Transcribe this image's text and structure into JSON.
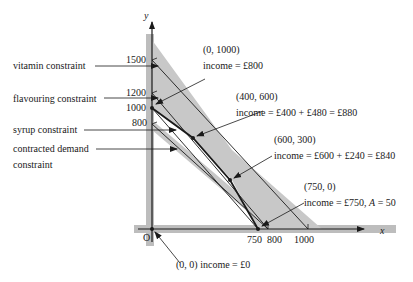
{
  "axes": {
    "x_label": "x",
    "y_label": "y",
    "origin_label": "O",
    "x_ticks": [
      "750",
      "800",
      "1000"
    ],
    "y_ticks": [
      "1500",
      "1200",
      "1000",
      "800"
    ]
  },
  "left_labels": {
    "vitamin": "vitamin constraint",
    "flavouring": "flavouring constraint",
    "syrup": "syrup constraint",
    "contracted_line1": "contracted demand",
    "contracted_line2": "constraint"
  },
  "annotations": {
    "p1_coord": "(0, 1000)",
    "p1_income": "income = £800",
    "p2_coord": "(400, 600)",
    "p2_income": "income = £400 + £480 = £880",
    "p3_coord": "(600, 300)",
    "p3_income": "income = £600 + £240 = £840",
    "p4_coord": "(750, 0)",
    "p4_income_prefix": "income = £750, ",
    "p4_income_var": "A",
    "p4_income_suffix": " = 50",
    "origin": "(0, 0) income = £0"
  },
  "colors": {
    "shade": "#c8c8c8",
    "line": "#1a1a1a",
    "axis_band": "#bdbdbd"
  }
}
